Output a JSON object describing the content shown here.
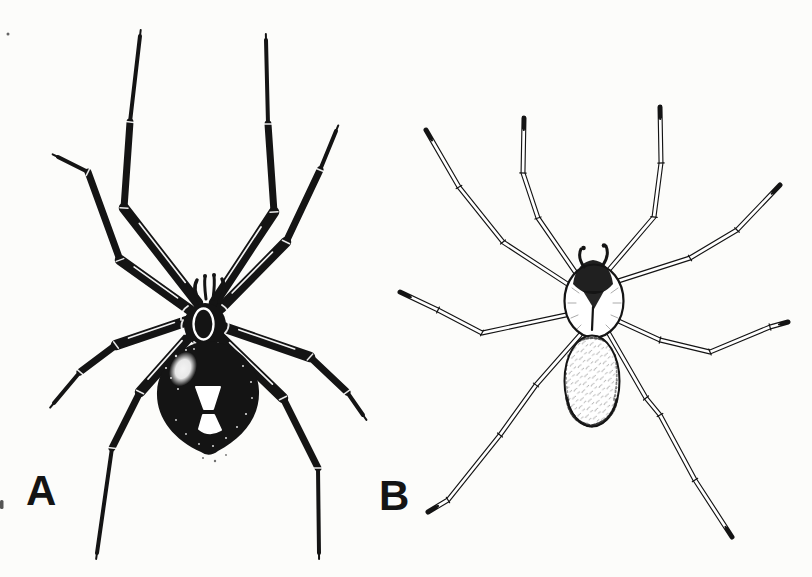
{
  "figure": {
    "labels": {
      "panel_a": "A",
      "panel_b": "B"
    },
    "illustrations": {
      "panel_a": "black-widow-spider-illustration",
      "panel_a_marking": "white-hourglass-marking",
      "panel_b": "brown-recluse-spider-illustration",
      "panel_b_marking": "dark-violin-marking"
    },
    "colors": {
      "background": "#fcfcfa",
      "ink": "#141414",
      "marking_fill": "#ffffff"
    }
  }
}
